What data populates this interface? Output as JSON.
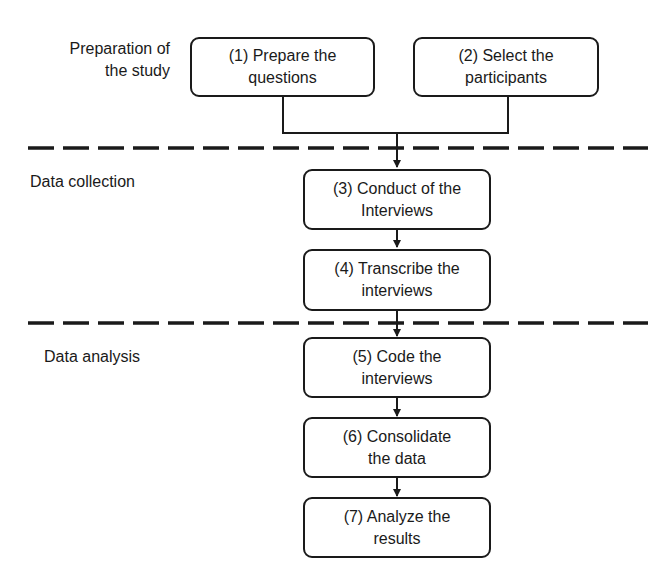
{
  "stages": [
    {
      "label_line1": "Preparation of",
      "label_line2": "the study"
    },
    {
      "label_line1": "Data collection",
      "label_line2": ""
    },
    {
      "label_line1": "Data analysis",
      "label_line2": ""
    }
  ],
  "steps": [
    {
      "line1": "(1) Prepare the",
      "line2": "questions"
    },
    {
      "line1": "(2) Select the",
      "line2": "participants"
    },
    {
      "line1": "(3) Conduct of the",
      "line2": "Interviews"
    },
    {
      "line1": "(4) Transcribe the",
      "line2": "interviews"
    },
    {
      "line1": "(5) Code the",
      "line2": "interviews"
    },
    {
      "line1": "(6) Consolidate",
      "line2": "the data"
    },
    {
      "line1": "(7) Analyze the",
      "line2": "results"
    }
  ],
  "colors": {
    "stroke": "#1a1a1a",
    "background": "#ffffff"
  }
}
